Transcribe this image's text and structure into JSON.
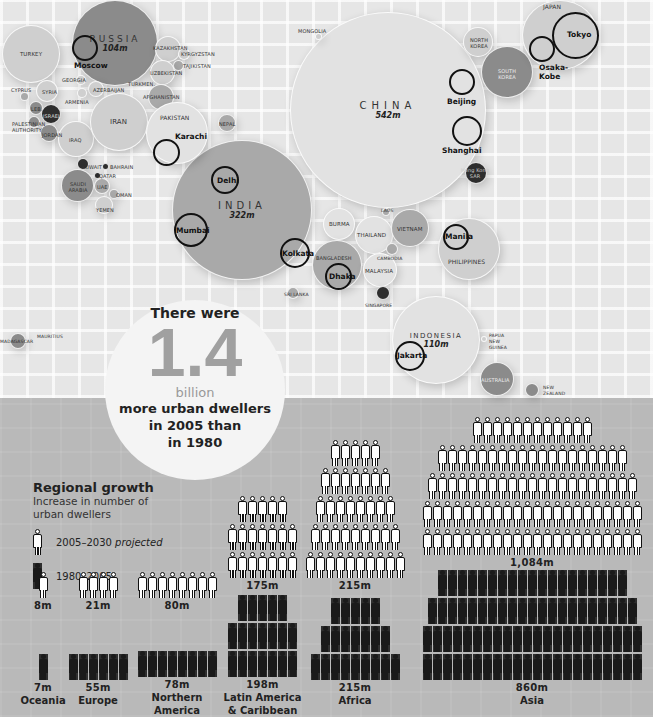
{
  "map": {
    "countries": [
      {
        "name": "RUSSIA",
        "value": "104m"
      },
      {
        "name": "CHINA",
        "value": "542m"
      },
      {
        "name": "INDIA",
        "value": "322m"
      },
      {
        "name": "INDONESIA",
        "value": "110m"
      },
      {
        "name": "TURKEY"
      },
      {
        "name": "KAZAKHSTAN"
      },
      {
        "name": "KYRGYZSTAN"
      },
      {
        "name": "TAJIKISTAN"
      },
      {
        "name": "UZBEKISTAN"
      },
      {
        "name": "TURKMEN."
      },
      {
        "name": "GEORGIA"
      },
      {
        "name": "AZERBAIJAN"
      },
      {
        "name": "ARMENIA"
      },
      {
        "name": "AFGHANISTAN"
      },
      {
        "name": "CYPRUS"
      },
      {
        "name": "SYRIA"
      },
      {
        "name": "LEB."
      },
      {
        "name": "ISRAEL"
      },
      {
        "name": "PALESTINIAN AUTHORITY"
      },
      {
        "name": "JORDAN"
      },
      {
        "name": "IRAQ"
      },
      {
        "name": "IRAN"
      },
      {
        "name": "PAKISTAN"
      },
      {
        "name": "NEPAL"
      },
      {
        "name": "KUWAIT"
      },
      {
        "name": "BAHRAIN"
      },
      {
        "name": "QATAR"
      },
      {
        "name": "SAUDI ARABIA"
      },
      {
        "name": "UAE"
      },
      {
        "name": "OMAN"
      },
      {
        "name": "YEMEN"
      },
      {
        "name": "MONGOLIA"
      },
      {
        "name": "NORTH KOREA"
      },
      {
        "name": "SOUTH KOREA"
      },
      {
        "name": "JAPAN"
      },
      {
        "name": "Hong Kong SAR"
      },
      {
        "name": "LAOS"
      },
      {
        "name": "BURMA"
      },
      {
        "name": "THAILAND"
      },
      {
        "name": "VIETNAM"
      },
      {
        "name": "CAMBODIA"
      },
      {
        "name": "BANGLADESH"
      },
      {
        "name": "MALAYSIA"
      },
      {
        "name": "SRI LANKA"
      },
      {
        "name": "SINGAPORE"
      },
      {
        "name": "PHILIPPINES"
      },
      {
        "name": "PAPUA NEW GUINEA"
      },
      {
        "name": "AUSTRALIA"
      },
      {
        "name": "NEW ZEALAND"
      },
      {
        "name": "MADAGASCAR"
      },
      {
        "name": "MAURITIUS"
      }
    ],
    "cities": [
      "Moscow",
      "Karachi",
      "Delhi",
      "Mumbai",
      "Kolkata",
      "Dhaka",
      "Beijing",
      "Shanghai",
      "Tokyo",
      "Osaka-Kobe",
      "Manila",
      "Jakarta"
    ]
  },
  "callout": {
    "line1": "There were",
    "number": "1.4",
    "unit": "billion",
    "line2": "more urban dwellers",
    "line3": "in 2005 than",
    "line4": "in 1980"
  },
  "legend": {
    "title": "Regional growth",
    "subtitle1": "Increase in number of",
    "subtitle2": "urban dwellers",
    "projected_label": "2005–2030",
    "projected_suffix": "projected",
    "past_label": "1980–2005"
  },
  "chart_data": {
    "type": "bar",
    "title": "Regional growth",
    "subtitle": "Increase in number of urban dwellers",
    "categories": [
      "Oceania",
      "Europe",
      "Northern America",
      "Latin America & Caribbean",
      "Africa",
      "Asia"
    ],
    "series": [
      {
        "name": "1980–2005",
        "values": [
          7,
          55,
          78,
          198,
          215,
          860
        ]
      },
      {
        "name": "2005–2030 projected",
        "values": [
          8,
          21,
          80,
          175,
          215,
          1084
        ]
      }
    ],
    "unit": "million",
    "headline": {
      "value": 1.4,
      "unit": "billion",
      "text": "more urban dwellers in 2005 than in 1980"
    }
  },
  "regions": [
    {
      "name": "Oceania",
      "past": "7m",
      "proj": "8m",
      "past_rows": [
        1
      ],
      "proj_rows": [
        1
      ]
    },
    {
      "name": "Europe",
      "past": "55m",
      "proj": "21m",
      "past_rows": [
        6
      ],
      "proj_rows": [
        4
      ]
    },
    {
      "name": "Northern America",
      "name1": "Northern",
      "name2": "America",
      "past": "78m",
      "proj": "80m",
      "past_rows": [
        8
      ],
      "proj_rows": [
        8
      ]
    },
    {
      "name": "Latin America & Caribbean",
      "name1": "Latin America",
      "name2": "& Caribbean",
      "past": "198m",
      "proj": "175m",
      "past_rows": [
        5,
        7,
        7
      ],
      "proj_rows": [
        5,
        7,
        7
      ]
    },
    {
      "name": "Africa",
      "past": "215m",
      "proj": "215m",
      "past_rows": [
        5,
        7,
        9
      ],
      "proj_rows": [
        5,
        7,
        8,
        9,
        10
      ]
    },
    {
      "name": "Asia",
      "past": "860m",
      "proj": "1,084m",
      "past_rows": [
        19,
        21,
        22,
        22
      ],
      "proj_rows": [
        12,
        19,
        21,
        22,
        22
      ]
    }
  ]
}
